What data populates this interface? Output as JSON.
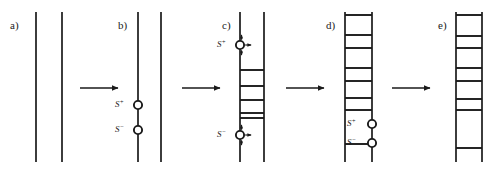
{
  "figure": {
    "background_color": "#ffffff",
    "line_color": "#1a1a1a",
    "canvas": {
      "width": 495,
      "height": 169
    }
  },
  "panels": [
    {
      "id": "a",
      "letter": "a)",
      "letter_x": 10,
      "letter_y": 29,
      "left_x": 36,
      "right_x": 62,
      "top_y": 12,
      "bottom_y": 162,
      "rungs": [],
      "sites": [],
      "description": "two bare parallel chains"
    },
    {
      "id": "b",
      "letter": "b)",
      "letter_x": 118,
      "letter_y": 29,
      "left_x": 138,
      "right_x": 161,
      "top_y": 12,
      "bottom_y": 162,
      "rungs": [],
      "sites": [
        {
          "label": "S",
          "charge": "+",
          "x": 138,
          "y": 105,
          "label_x": 124,
          "label_y": 107,
          "arrows": false
        },
        {
          "label": "S",
          "charge": "−",
          "x": 138,
          "y": 130,
          "label_x": 124,
          "label_y": 132,
          "arrows": false
        }
      ],
      "description": "two active sites S+ and S- appear on the left chain"
    },
    {
      "id": "c",
      "letter": "c)",
      "letter_x": 222,
      "letter_y": 29,
      "left_x": 240,
      "right_x": 264,
      "top_y": 12,
      "bottom_y": 162,
      "rungs": [
        {
          "y": 70,
          "from": "left",
          "to": "right"
        },
        {
          "y": 86,
          "from": "left",
          "to": "right"
        },
        {
          "y": 100,
          "from": "left",
          "to": "right"
        },
        {
          "y": 113,
          "from": "left",
          "to": "right"
        },
        {
          "y": 118,
          "from": "left",
          "to": "right"
        }
      ],
      "sites": [
        {
          "label": "S",
          "charge": "+",
          "x": 240,
          "y": 45,
          "label_x": 226,
          "label_y": 47,
          "arrows": true
        },
        {
          "label": "S",
          "charge": "−",
          "x": 240,
          "y": 135,
          "label_x": 226,
          "label_y": 137,
          "arrows": true
        }
      ],
      "description": "sites move apart (arrows) leaving rungs behind"
    },
    {
      "id": "d",
      "letter": "d)",
      "letter_x": 326,
      "letter_y": 29,
      "left_x": 345,
      "right_x": 372,
      "top_y": 12,
      "bottom_y": 162,
      "rungs": [
        {
          "y": 15,
          "from": "left",
          "to": "right"
        },
        {
          "y": 35,
          "from": "left",
          "to": "right"
        },
        {
          "y": 48,
          "from": "left",
          "to": "right"
        },
        {
          "y": 68,
          "from": "left",
          "to": "right"
        },
        {
          "y": 81,
          "from": "left",
          "to": "right"
        },
        {
          "y": 98,
          "from": "left",
          "to": "right"
        },
        {
          "y": 110,
          "from": "left",
          "to": "right"
        },
        {
          "y": 144,
          "from": "left",
          "to": "right"
        }
      ],
      "sites": [
        {
          "label": "S",
          "charge": "+",
          "x": 372,
          "y": 124,
          "label_x": 356,
          "label_y": 126,
          "arrows": false
        },
        {
          "label": "S",
          "charge": "−",
          "x": 372,
          "y": 143,
          "label_x": 356,
          "label_y": 145,
          "arrows": false
        }
      ],
      "description": "most of the ladder is zipped; sites near the bottom on the right chain"
    },
    {
      "id": "e",
      "letter": "e)",
      "letter_x": 438,
      "letter_y": 29,
      "left_x": 456,
      "right_x": 482,
      "top_y": 12,
      "bottom_y": 162,
      "rungs": [
        {
          "y": 15,
          "from": "left",
          "to": "right"
        },
        {
          "y": 36,
          "from": "left",
          "to": "right"
        },
        {
          "y": 48,
          "from": "left",
          "to": "right"
        },
        {
          "y": 68,
          "from": "left",
          "to": "right"
        },
        {
          "y": 81,
          "from": "left",
          "to": "right"
        },
        {
          "y": 99,
          "from": "left",
          "to": "right"
        },
        {
          "y": 110,
          "from": "left",
          "to": "right"
        },
        {
          "y": 148,
          "from": "left",
          "to": "right"
        }
      ],
      "sites": [],
      "description": "completed ladder, sites consumed"
    }
  ],
  "arrows": [
    {
      "id": "a-to-b",
      "x1": 80,
      "x2": 118,
      "y": 88
    },
    {
      "id": "b-to-c",
      "x1": 182,
      "x2": 220,
      "y": 88
    },
    {
      "id": "c-to-d",
      "x1": 286,
      "x2": 324,
      "y": 88
    },
    {
      "id": "d-to-e",
      "x1": 392,
      "x2": 430,
      "y": 88
    }
  ],
  "site_arrow_glyph": {
    "name": "four-way-move-arrows",
    "directions": [
      "up",
      "down",
      "right"
    ]
  }
}
